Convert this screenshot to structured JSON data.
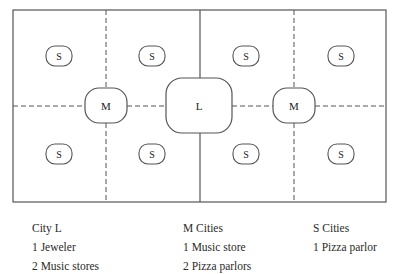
{
  "diagram": {
    "large_city": {
      "label": "L"
    },
    "medium_cities": [
      {
        "label": "M"
      },
      {
        "label": "M"
      }
    ],
    "small_cities": [
      {
        "label": "S"
      },
      {
        "label": "S"
      },
      {
        "label": "S"
      },
      {
        "label": "S"
      },
      {
        "label": "S"
      },
      {
        "label": "S"
      },
      {
        "label": "S"
      },
      {
        "label": "S"
      }
    ]
  },
  "legend": {
    "city_l": {
      "title": "City L",
      "items": [
        "1 Jeweler",
        "2 Music stores"
      ]
    },
    "m_cities": {
      "title": "M Cities",
      "items": [
        "1 Music store",
        "2 Pizza parlors"
      ]
    },
    "s_cities": {
      "title": "S Cities",
      "items": [
        "1 Pizza parlor"
      ]
    }
  }
}
